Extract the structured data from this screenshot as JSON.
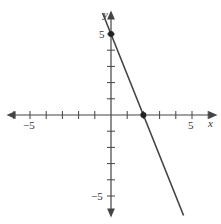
{
  "chart_data": {
    "type": "line",
    "title": "",
    "xlabel": "x",
    "ylabel": "y",
    "xlim": [
      -6,
      6
    ],
    "ylim": [
      -6,
      6
    ],
    "grid": false,
    "tick_step": 1,
    "x_tick_labels": [
      "-5",
      "5"
    ],
    "y_tick_labels": [
      "5",
      "-5"
    ],
    "series": [
      {
        "name": "line",
        "equation": "y = -2.5x + 5",
        "slope": -2.5,
        "intercept": 5
      }
    ],
    "points": [
      {
        "x": 0,
        "y": 5,
        "label": "y-intercept"
      },
      {
        "x": 2,
        "y": 0,
        "label": "x-intercept"
      }
    ]
  },
  "labels": {
    "x_axis": "x",
    "y_axis": "y",
    "x_neg5": "−5",
    "x_pos5": "5",
    "y_pos5": "5",
    "y_neg5": "−5"
  }
}
